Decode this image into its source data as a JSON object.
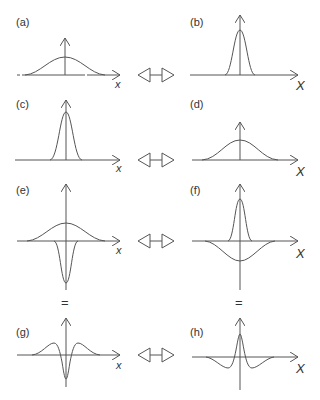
{
  "figure": {
    "panels": [
      {
        "id": "a",
        "label": "(a)",
        "axis_label": "x",
        "description": "wide Gaussian, real space"
      },
      {
        "id": "b",
        "label": "(b)",
        "axis_label": "X",
        "description": "narrow Gaussian, Fourier space"
      },
      {
        "id": "c",
        "label": "(c)",
        "axis_label": "x",
        "description": "narrow Gaussian, real space"
      },
      {
        "id": "d",
        "label": "(d)",
        "axis_label": "X",
        "description": "wide Gaussian, Fourier space"
      },
      {
        "id": "e",
        "label": "(e)",
        "axis_label": "x",
        "description": "wide positive Gaussian plus narrow negative Gaussian"
      },
      {
        "id": "f",
        "label": "(f)",
        "axis_label": "X",
        "description": "narrow positive Gaussian plus wide negative Gaussian"
      },
      {
        "id": "g",
        "label": "(g)",
        "axis_label": "x",
        "description": "difference of Gaussians, real space"
      },
      {
        "id": "h",
        "label": "(h)",
        "axis_label": "X",
        "description": "difference of Gaussians, Fourier space"
      }
    ],
    "equals_sign": "=",
    "transform_arrow": "fourier-transform-pair-arrow"
  }
}
